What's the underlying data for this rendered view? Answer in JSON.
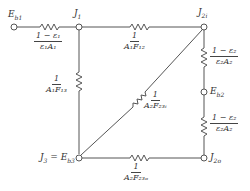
{
  "nodes": {
    "eb1": "E_b1",
    "j1": "J_1",
    "j2i": "J_2i",
    "eb2": "E_b2",
    "j3": "J_3 = E_b3",
    "j2o": "J_2o"
  },
  "resistors": {
    "r_eb1_j1": {
      "num": "1 − ε₁",
      "den": "ε₁A₁"
    },
    "r_j1_j2i": {
      "num": "1",
      "den": "A₁F₁₂"
    },
    "r_j1_j3": {
      "num": "1",
      "den": "A₁F₁₃"
    },
    "r_j3_j2i": {
      "num": "1",
      "den": "A₂F₂₃ᵢ"
    },
    "r_j2i_eb2": {
      "num": "1 − ε₂",
      "den": "ε₂A₂"
    },
    "r_eb2_j2o": {
      "num": "1 − ε₂",
      "den": "ε₂A₂"
    },
    "r_j3_j2o": {
      "num": "1",
      "den": "A₂F₂₃ₒ"
    }
  },
  "labels": {
    "eb1": "E",
    "eb1_sub": "b1",
    "j1": "J",
    "j1_sub": "1",
    "j2i": "J",
    "j2i_sub": "2i",
    "eb2": "E",
    "eb2_sub": "b2",
    "j3": "J",
    "j3_sub": "3",
    "j3_eq": " = E",
    "j3_eq_sub": "b3",
    "j2o": "J",
    "j2o_sub": "2o"
  }
}
